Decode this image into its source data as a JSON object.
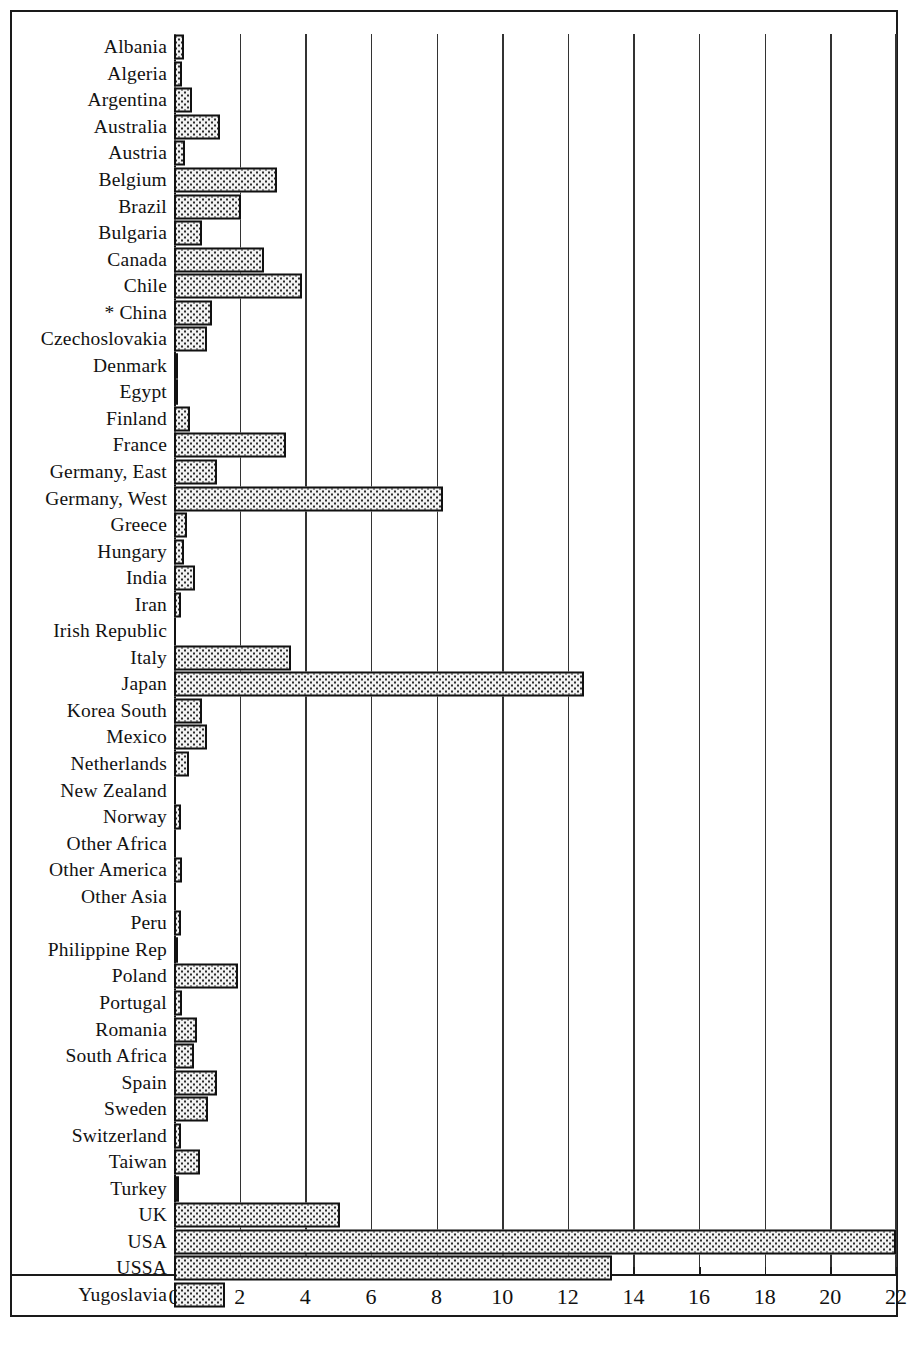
{
  "chart_data": {
    "type": "bar",
    "orientation": "horizontal",
    "title": "",
    "xlabel": "",
    "ylabel": "",
    "xlim": [
      0,
      22
    ],
    "xticks": [
      0,
      2,
      4,
      6,
      8,
      10,
      12,
      14,
      16,
      18,
      20,
      22
    ],
    "grid": true,
    "legend": null,
    "categories": [
      "Albania",
      "Algeria",
      "Argentina",
      "Australia",
      "Austria",
      "Belgium",
      "Brazil",
      "Bulgaria",
      "Canada",
      "Chile",
      "* China",
      "Czechoslovakia",
      "Denmark",
      "Egypt",
      "Finland",
      "France",
      "Germany, East",
      "Germany, West",
      "Greece",
      "Hungary",
      "India",
      "Iran",
      "Irish Republic",
      "Italy",
      "Japan",
      "Korea  South",
      "Mexico",
      "Netherlands",
      "New Zealand",
      "Norway",
      "Other Africa",
      "Other America",
      "Other Asia",
      "Peru",
      "Philippine Rep",
      "Poland",
      "Portugal",
      "Romania",
      "South Africa",
      "Spain",
      "Sweden",
      "Switzerland",
      "Taiwan",
      "Turkey",
      "UK",
      "USA",
      "USSA",
      "Yugoslavia"
    ],
    "values": [
      0.3,
      0.25,
      0.55,
      1.4,
      0.35,
      3.15,
      2.05,
      0.85,
      2.75,
      3.9,
      1.15,
      1.0,
      0.12,
      0.1,
      0.5,
      3.4,
      1.3,
      8.2,
      0.4,
      0.3,
      0.65,
      0.2,
      0.0,
      3.55,
      12.5,
      0.85,
      1.0,
      0.45,
      0.0,
      0.2,
      0.0,
      0.25,
      0.0,
      0.2,
      0.05,
      1.95,
      0.25,
      0.7,
      0.6,
      1.3,
      1.05,
      0.2,
      0.8,
      0.15,
      5.05,
      22.0,
      13.35,
      1.55
    ]
  },
  "axis": {
    "tick_labels": [
      "0",
      "2",
      "4",
      "6",
      "8",
      "10",
      "12",
      "14",
      "16",
      "18",
      "20",
      "22"
    ]
  },
  "style": {
    "bar_fill": "#f2f2f2",
    "bar_edge": "#111111",
    "grid_color": "#333333",
    "text_color": "#111111",
    "background": "#ffffff"
  }
}
